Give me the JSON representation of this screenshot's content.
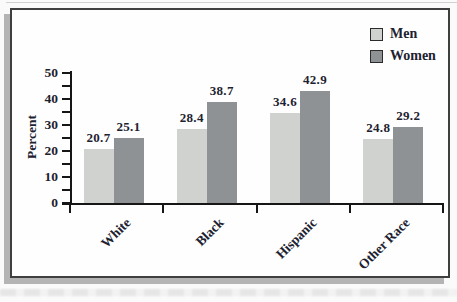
{
  "figure": {
    "background": "#fefefe",
    "frame_border_color": "#3f3f3f",
    "shadow_color": "#b4b4b4",
    "text_color": "#1d2230",
    "axis_color": "#161616"
  },
  "chart_data": {
    "type": "bar",
    "categories": [
      "White",
      "Black",
      "Hispanic",
      "Other Race"
    ],
    "series": [
      {
        "name": "Men",
        "color": "#cfd2ce",
        "values": [
          20.7,
          28.4,
          34.6,
          24.8
        ]
      },
      {
        "name": "Women",
        "color": "#8f9294",
        "values": [
          25.1,
          38.7,
          42.9,
          29.2
        ]
      }
    ],
    "title": "",
    "xlabel": "",
    "ylabel": "Percent",
    "ylim": [
      0,
      50
    ],
    "yticks": [
      0,
      10,
      20,
      30,
      40,
      50
    ],
    "minor_tick_step": 5,
    "grid": false,
    "legend_position": "top-right",
    "value_labels_shown": true,
    "value_label_format": "one-decimal"
  }
}
